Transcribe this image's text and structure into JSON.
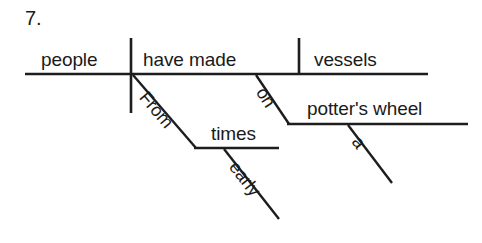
{
  "exercise": {
    "number": "7.",
    "type": "reed-kellogg-sentence-diagram",
    "sentence": "From early times people have made vessels on a potter's wheel"
  },
  "diagram": {
    "subject": "people",
    "verb": "have made",
    "direct_object": "vessels",
    "modifiers": {
      "prepositional_phrase_1": {
        "preposition": "From",
        "object": "times",
        "adjective": "early"
      },
      "prepositional_phrase_2": {
        "preposition": "on",
        "object": "potter's wheel",
        "article": "a"
      }
    }
  },
  "labels": {
    "people": "people",
    "have_made": "have made",
    "vessels": "vessels",
    "from": "From",
    "times": "times",
    "early": "early",
    "on": "on",
    "potters_wheel": "potter's wheel",
    "a": "a"
  },
  "colors": {
    "ink": "#1d1d1d",
    "background": "#ffffff"
  }
}
